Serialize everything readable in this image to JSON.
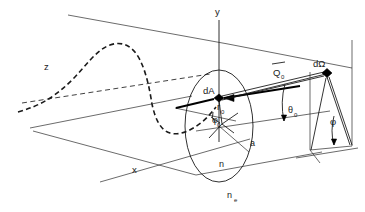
{
  "figure": {
    "type": "technical-line-diagram",
    "background_color": "#ffffff",
    "line_color": "#1a1a1a"
  },
  "axes": {
    "y": {
      "label": "y",
      "x": 218,
      "y": 12,
      "direction": "vertical-up"
    },
    "x": {
      "label": "x",
      "x": 136,
      "y": 170,
      "direction": "lower-left"
    },
    "z": {
      "label": "z",
      "x": 48,
      "y": 67,
      "direction": "upper-left-depth"
    }
  },
  "labels": {
    "area_element": {
      "text": "dA",
      "x": 207,
      "y": 90
    },
    "solid_angle": {
      "text": "dΩ",
      "x": 318,
      "y": 64
    },
    "wavevector": {
      "text": "Q",
      "sub": "0",
      "overbar": true,
      "x": 277,
      "y": 72
    },
    "theta_zero": {
      "text": "θ",
      "sub": "0",
      "x": 288,
      "y": 113
    },
    "phi_detector": {
      "text": "φ",
      "x": 332,
      "y": 122
    },
    "phi_zero": {
      "text": "φ",
      "sub": "0",
      "x": 216,
      "y": 120
    },
    "r_zero": {
      "text": "r",
      "sub": "0",
      "x": 220,
      "y": 107
    },
    "radius_a": {
      "text": "a",
      "x": 252,
      "y": 146
    },
    "index_n": {
      "text": "n",
      "x": 222,
      "y": 164
    },
    "index_ne": {
      "text": "n",
      "sub": "e",
      "x": 232,
      "y": 196
    }
  },
  "elements": {
    "incident_wave": {
      "name": "incident-sinusoidal-wave",
      "style": "dashed",
      "description": "dashed sinusoid propagating along z toward the aperture"
    },
    "aperture_disk": {
      "name": "circular-aperture",
      "style": "ellipse-perspective",
      "radius_label": "a",
      "interior_index": "n",
      "exterior_index": "n_e"
    },
    "detector_plane": {
      "name": "detector-plane",
      "style": "solid-parallelogram"
    },
    "scattered_ray": {
      "name": "scattered-ray-bundle",
      "from": "dA",
      "to": "dΩ"
    }
  }
}
